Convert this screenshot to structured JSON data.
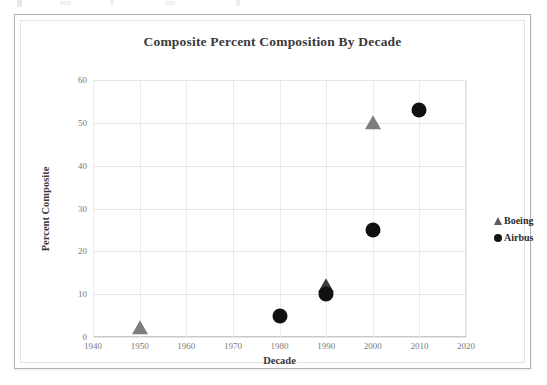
{
  "figure": {
    "title": "Composite Percent Composition By Decade"
  },
  "chart_data": {
    "type": "scatter",
    "title": "Composite Percent Composition By Decade",
    "xlabel": "Decade",
    "ylabel": "Percent Composite",
    "xlim": [
      1940,
      2020
    ],
    "ylim": [
      0,
      60
    ],
    "xticks": [
      "1940",
      "1950",
      "1960",
      "1970",
      "1980",
      "1990",
      "2000",
      "2010",
      "2020"
    ],
    "yticks": [
      "0",
      "10",
      "20",
      "30",
      "40",
      "50",
      "60"
    ],
    "grid": true,
    "legend_position": "right",
    "series": [
      {
        "name": "Boeing",
        "marker": "triangle",
        "color": "#7d7d7d",
        "points": [
          {
            "x": 1950,
            "y": 2
          },
          {
            "x": 1990,
            "y": 12
          },
          {
            "x": 2000,
            "y": 50
          }
        ]
      },
      {
        "name": "Airbus",
        "marker": "circle",
        "color": "#111111",
        "points": [
          {
            "x": 1980,
            "y": 5
          },
          {
            "x": 1990,
            "y": 10
          },
          {
            "x": 2000,
            "y": 25
          },
          {
            "x": 2010,
            "y": 53
          }
        ]
      }
    ]
  },
  "legend": {
    "entries": [
      {
        "label": "Boeing",
        "marker": "triangle-icon"
      },
      {
        "label": "Airbus",
        "marker": "circle-icon"
      }
    ]
  }
}
